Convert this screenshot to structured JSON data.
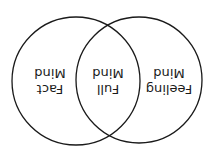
{
  "diagram": {
    "type": "venn",
    "orientation": "rotated-180",
    "circles": [
      {
        "name": "left",
        "label_line1": "Feeling",
        "label_line2": "Mind"
      },
      {
        "name": "right",
        "label_line1": "Fact",
        "label_line2": "Mind"
      }
    ],
    "intersection": {
      "label_line1": "Full",
      "label_line2": "Mind"
    },
    "colors": {
      "stroke": "#1a1a1a",
      "background": "#ffffff"
    }
  }
}
